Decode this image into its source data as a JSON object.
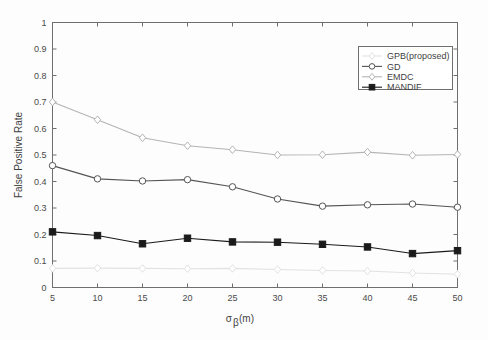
{
  "chart_data": {
    "type": "line",
    "title": "",
    "xlabel": "σβ(m)",
    "xlabel_base": "σ",
    "xlabel_sub": "β",
    "xlabel_unit": "(m)",
    "ylabel": "False Positive Rate",
    "x": [
      5,
      10,
      15,
      20,
      25,
      30,
      35,
      40,
      45,
      50
    ],
    "xlim": [
      5,
      50
    ],
    "ylim": [
      0,
      1
    ],
    "xticks": [
      "5",
      "10",
      "15",
      "20",
      "25",
      "30",
      "35",
      "40",
      "45",
      "50"
    ],
    "yticks": [
      "0",
      "0.1",
      "0.2",
      "0.3",
      "0.4",
      "0.5",
      "0.6",
      "0.7",
      "0.8",
      "0.9",
      "1"
    ],
    "grid": false,
    "legend_position": "upper right",
    "series": [
      {
        "name": "GPB(proposed)",
        "marker": "diamond",
        "color": "#e2e2e2",
        "filled": false,
        "values": [
          0.072,
          0.073,
          0.072,
          0.071,
          0.072,
          0.068,
          0.064,
          0.062,
          0.055,
          0.05
        ]
      },
      {
        "name": "GD",
        "marker": "circle",
        "color": "#545454",
        "filled": false,
        "values": [
          0.46,
          0.41,
          0.402,
          0.407,
          0.38,
          0.334,
          0.307,
          0.312,
          0.315,
          0.303
        ]
      },
      {
        "name": "EMDC",
        "marker": "diamond",
        "color": "#b4b4b4",
        "filled": false,
        "values": [
          0.7,
          0.633,
          0.565,
          0.535,
          0.52,
          0.5,
          0.501,
          0.511,
          0.499,
          0.502
        ]
      },
      {
        "name": "MANDIF",
        "marker": "square",
        "color": "#1a1a1a",
        "filled": true,
        "values": [
          0.21,
          0.196,
          0.165,
          0.186,
          0.172,
          0.171,
          0.163,
          0.153,
          0.128,
          0.139
        ]
      }
    ]
  },
  "legend": {
    "entries": [
      {
        "label": "GPB(proposed)"
      },
      {
        "label": "GD"
      },
      {
        "label": "EMDC"
      },
      {
        "label": "MANDIF"
      }
    ]
  }
}
